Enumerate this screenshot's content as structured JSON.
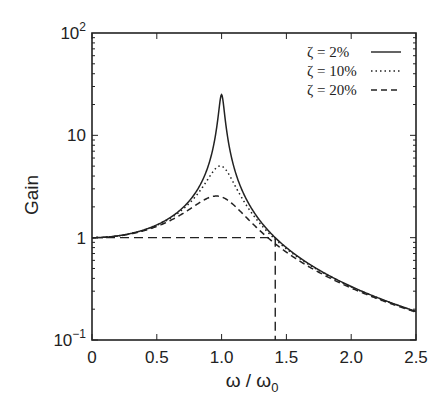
{
  "chart_data": {
    "type": "line",
    "title": "",
    "xlabel": "ω / ω0",
    "xlabel_main": "ω / ω",
    "xlabel_sub": "0",
    "ylabel": "Gain",
    "xlim": [
      0,
      2.5
    ],
    "ylim": [
      0.1,
      100
    ],
    "yscale": "log",
    "grid": false,
    "legend_position": "upper right",
    "x_ticks": [
      {
        "value": 0,
        "label": "0"
      },
      {
        "value": 0.5,
        "label": "0.5"
      },
      {
        "value": 1.0,
        "label": "1.0"
      },
      {
        "value": 1.5,
        "label": "1.5"
      },
      {
        "value": 2.0,
        "label": "2.0"
      },
      {
        "value": 2.5,
        "label": "2.5"
      }
    ],
    "y_ticks": [
      {
        "value": 100,
        "label_base": "10",
        "label_exp": "2"
      },
      {
        "value": 10,
        "label_base": "10",
        "label_exp": ""
      },
      {
        "value": 1,
        "label_base": "1",
        "label_exp": ""
      },
      {
        "value": 0.1,
        "label_base": "10",
        "label_exp": "−1"
      }
    ],
    "series": [
      {
        "name": "ζ =  2%",
        "zeta": 0.02,
        "style": "solid",
        "x": [
          0,
          0.5,
          0.8,
          0.9,
          0.95,
          1.0,
          1.05,
          1.1,
          1.2,
          1.414,
          1.5,
          2.0,
          2.5
        ],
        "values": [
          1.0,
          1.33,
          2.77,
          5.25,
          9.9,
          25.0,
          9.5,
          4.74,
          2.27,
          1.0,
          0.8,
          0.333,
          0.19
        ]
      },
      {
        "name": "ζ = 10%",
        "zeta": 0.1,
        "style": "dotted",
        "x": [
          0,
          0.5,
          0.8,
          0.9,
          0.95,
          1.0,
          1.05,
          1.1,
          1.2,
          1.414,
          1.5,
          2.0,
          2.5
        ],
        "values": [
          1.0,
          1.32,
          2.53,
          3.7,
          4.5,
          5.0,
          4.4,
          3.4,
          1.99,
          1.0,
          0.8,
          0.34,
          0.2
        ]
      },
      {
        "name": "ζ = 20%",
        "zeta": 0.2,
        "style": "dashed",
        "x": [
          0,
          0.5,
          0.8,
          0.9,
          0.95,
          1.0,
          1.05,
          1.1,
          1.2,
          1.414,
          1.5,
          2.0,
          2.5
        ],
        "values": [
          1.0,
          1.3,
          2.05,
          2.43,
          2.55,
          2.55,
          2.4,
          2.16,
          1.65,
          1.0,
          0.83,
          0.38,
          0.24
        ]
      }
    ],
    "annotations": [
      {
        "type": "reference-line",
        "style": "long-dash",
        "description": "horizontal line at Gain = 1 from ω/ω0 = 0 to √2",
        "x": [
          0,
          1.414
        ],
        "y": [
          1,
          1
        ]
      },
      {
        "type": "reference-line",
        "style": "long-dash",
        "description": "vertical line at ω/ω0 = √2 from Gain = 1 down to the axis",
        "x": [
          1.414,
          1.414
        ],
        "y": [
          1,
          0.1
        ]
      }
    ]
  },
  "legend": {
    "items": [
      {
        "label": "ζ =  2%",
        "style": "solid"
      },
      {
        "label": "ζ = 10%",
        "style": "dotted"
      },
      {
        "label": "ζ = 20%",
        "style": "dashed"
      }
    ]
  },
  "colors": {
    "line": "#222222",
    "background": "#ffffff"
  }
}
